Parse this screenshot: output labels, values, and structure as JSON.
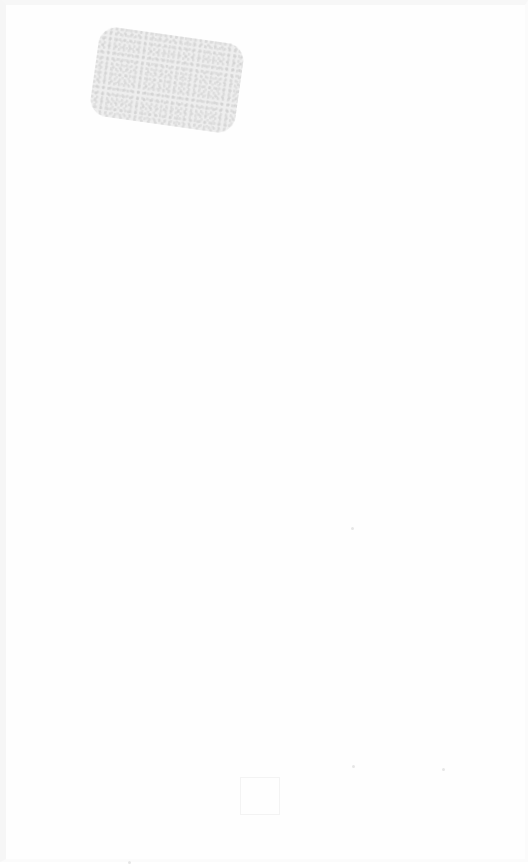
{
  "document": {
    "type": "scanned-page",
    "background_color": "#fefefe",
    "smudge": {
      "description": "gray noisy rectangle",
      "color": "#ececec"
    },
    "bottom_text": "",
    "bottom_text_legible": false,
    "specks": [
      {
        "x": 345,
        "y": 522
      },
      {
        "x": 346,
        "y": 760
      },
      {
        "x": 436,
        "y": 763
      },
      {
        "x": 122,
        "y": 858
      }
    ]
  }
}
